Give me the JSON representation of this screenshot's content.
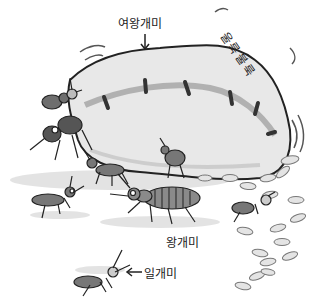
{
  "illustration": {
    "description": "Ant colony drawing: large swollen queen ant surrounded by worker ants and eggs",
    "colors": {
      "ink": "#222222",
      "queen_body": "#e6e6e6",
      "queen_stripe": "#9a9a9a",
      "ant_body": "#6e6e6e",
      "egg": "#d8d8d8",
      "ground": "#bdbdbd"
    }
  },
  "labels": {
    "queen": "여왕개미",
    "bumpy": "울룩불룩",
    "king_ant": "왕개미",
    "worker": "일개미"
  },
  "arrows": {
    "queen_arrow": "↓",
    "worker_arrow": "←"
  }
}
